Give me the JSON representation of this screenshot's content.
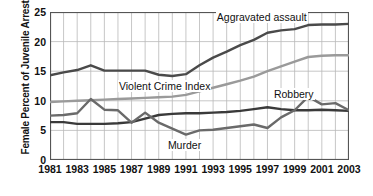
{
  "chart_data": {
    "type": "line",
    "title": "",
    "xlabel": "",
    "ylabel": "Female Percent of Juvenile Arrests",
    "xlim": [
      1981,
      2003
    ],
    "ylim": [
      0,
      25
    ],
    "yticks": [
      0,
      5,
      10,
      15,
      20,
      25
    ],
    "xticks": [
      1981,
      1983,
      1985,
      1987,
      1989,
      1991,
      1993,
      1995,
      1997,
      1999,
      2001,
      2003
    ],
    "grid": true,
    "legend_position": "inline-annotations",
    "x": [
      1981,
      1982,
      1983,
      1984,
      1985,
      1986,
      1987,
      1988,
      1989,
      1990,
      1991,
      1992,
      1993,
      1994,
      1995,
      1996,
      1997,
      1998,
      1999,
      2000,
      2001,
      2002,
      2003
    ],
    "series": [
      {
        "name": "Aggravated assault",
        "color": "#4a4a4a",
        "label_x": 1993.2,
        "label_y": 24.0,
        "values": [
          14.3,
          14.8,
          15.2,
          16.0,
          15.1,
          15.1,
          15.1,
          15.1,
          14.4,
          14.2,
          14.5,
          16.0,
          17.3,
          18.3,
          19.4,
          20.3,
          21.5,
          21.9,
          22.1,
          22.8,
          22.9,
          22.9,
          23.0
        ]
      },
      {
        "name": "Violent Crime Index",
        "color": "#9a9a9a",
        "label_x": 1986.0,
        "label_y": 12.4,
        "values": [
          9.8,
          9.9,
          10.0,
          10.1,
          10.2,
          10.3,
          10.4,
          10.5,
          10.6,
          10.7,
          11.0,
          11.6,
          12.2,
          12.8,
          13.4,
          14.1,
          15.0,
          15.8,
          16.6,
          17.4,
          17.6,
          17.7,
          17.7
        ]
      },
      {
        "name": "Robbery",
        "color": "#3a3a3a",
        "label_x": 1997.4,
        "label_y": 10.9,
        "values": [
          6.4,
          6.4,
          6.1,
          6.1,
          6.1,
          6.2,
          6.4,
          7.0,
          7.6,
          7.8,
          7.9,
          7.9,
          8.0,
          8.1,
          8.3,
          8.6,
          8.9,
          8.6,
          8.4,
          8.4,
          8.5,
          8.4,
          8.3
        ]
      },
      {
        "name": "Murder",
        "color": "#6a6a6a",
        "label_x": 1989.6,
        "label_y": 2.3,
        "values": [
          7.5,
          7.6,
          7.9,
          10.3,
          8.5,
          8.4,
          6.3,
          8.0,
          6.3,
          5.3,
          4.3,
          5.0,
          5.1,
          5.4,
          5.7,
          6.0,
          5.4,
          7.2,
          8.4,
          10.7,
          9.4,
          9.6,
          8.4
        ]
      }
    ]
  }
}
